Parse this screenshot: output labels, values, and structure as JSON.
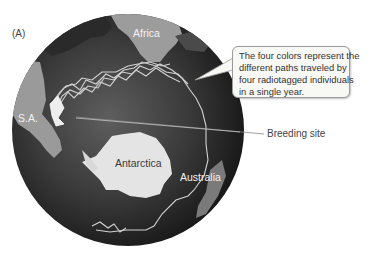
{
  "figure": {
    "panel_label": "(A)",
    "continents": {
      "africa": "Africa",
      "south_america": "S.A.",
      "antarctica": "Antarctica",
      "australia": "Australia"
    },
    "callout": {
      "lines": [
        "The four colors represent the",
        "different paths traveled by",
        "four radiotagged individuals",
        "in a single year."
      ]
    },
    "breeding_site_label": "Breeding site",
    "colors": {
      "ocean_dark": "#1c1c1c",
      "ocean_light": "#6a6a6a",
      "land": "#c8c8c8",
      "antarctica": "#e6e6e6",
      "paths": "#d0d0d0"
    }
  }
}
